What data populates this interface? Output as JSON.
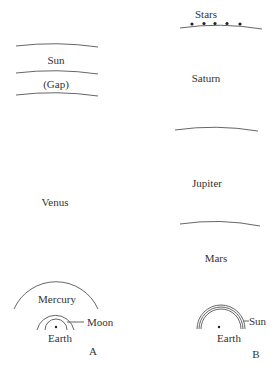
{
  "colors": {
    "line": "#555555",
    "text": "#333333",
    "background": "#ffffff"
  },
  "panel_a": {
    "id_label": "A",
    "layers": [
      "Sun",
      "(Gap)",
      "Venus",
      "Mercury"
    ],
    "sun_label": "Sun",
    "gap_label": "(Gap)",
    "venus_label": "Venus",
    "mercury_label": "Mercury",
    "moon_label": "Moon",
    "earth_label": "Earth"
  },
  "panel_b": {
    "id_label": "B",
    "layers": [
      "Stars",
      "Saturn",
      "Jupiter",
      "Mars",
      "Sun"
    ],
    "stars_label": "Stars",
    "saturn_label": "Saturn",
    "jupiter_label": "Jupiter",
    "mars_label": "Mars",
    "sun_label": "Sun",
    "earth_label": "Earth",
    "star_count": 5
  }
}
